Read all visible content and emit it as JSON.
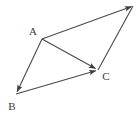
{
  "figure": {
    "background_color": "#ffffff",
    "stroke_color": "#4a4a4a",
    "label_color": "#3a3a3a",
    "stroke_width": 1.1,
    "width": 137,
    "height": 114
  },
  "vertices": [
    {
      "id": "A",
      "label": "A",
      "x": 42,
      "y": 39,
      "label_x": 33,
      "label_y": 35,
      "labeled": true
    },
    {
      "id": "B",
      "label": "B",
      "x": 16,
      "y": 94,
      "label_x": 9,
      "label_y": 110,
      "labeled": true
    },
    {
      "id": "C",
      "label": "C",
      "x": 98,
      "y": 70,
      "label_x": 103,
      "label_y": 80,
      "labeled": true
    },
    {
      "id": "D",
      "label": "",
      "x": 133,
      "y": 6,
      "label_x": 0,
      "label_y": 0,
      "labeled": false
    }
  ],
  "edges": [
    {
      "id": "A-to-D",
      "from": "A",
      "to": "D",
      "x1": 42,
      "y1": 39,
      "x2": 133,
      "y2": 6,
      "arrowhead": "end"
    },
    {
      "id": "A-to-B",
      "from": "A",
      "to": "B",
      "x1": 42,
      "y1": 39,
      "x2": 16,
      "y2": 94,
      "arrowhead": "end"
    },
    {
      "id": "A-to-C",
      "from": "A",
      "to": "C",
      "x1": 42,
      "y1": 39,
      "x2": 98,
      "y2": 70,
      "arrowhead": "end"
    },
    {
      "id": "B-to-C",
      "from": "B",
      "to": "C",
      "x1": 16,
      "y1": 94,
      "x2": 98,
      "y2": 70,
      "arrowhead": "end"
    },
    {
      "id": "D-to-C",
      "from": "D",
      "to": "C",
      "x1": 133,
      "y1": 6,
      "x2": 98,
      "y2": 70,
      "arrowhead": "none"
    }
  ]
}
